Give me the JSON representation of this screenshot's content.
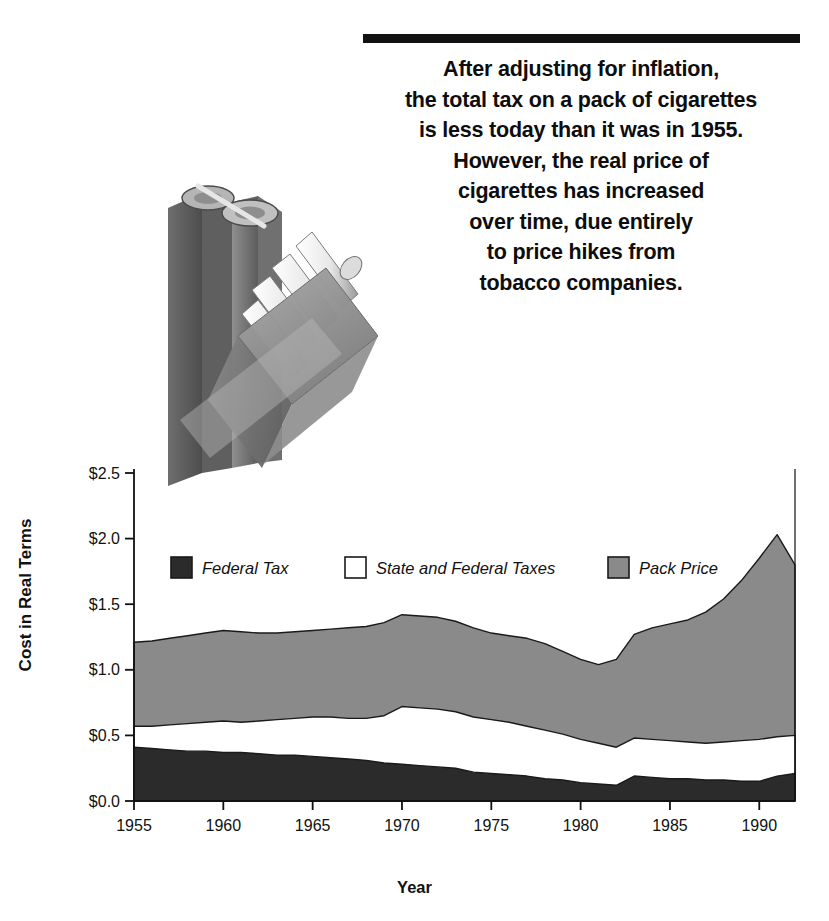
{
  "headline": {
    "lines": [
      "After adjusting for inflation,",
      "the total tax on a pack of cigarettes",
      "is less today than it was in 1955.",
      "However, the real price of",
      "cigarettes has increased",
      "over time, due entirely",
      "to price hikes from",
      "tobacco companies."
    ]
  },
  "illustration": {
    "name": "dollar-sign-and-cigarette-pack",
    "description": "Grayscale illustration of a dollar-sign shaped block beside an open pack of cigarettes"
  },
  "chart_data": {
    "type": "area",
    "stacked": true,
    "title": "",
    "xlabel": "Year",
    "ylabel": "Cost in Real Terms",
    "xlim": [
      1955,
      1992
    ],
    "ylim": [
      0.0,
      2.5
    ],
    "grid": false,
    "legend_position": "inside-top-left",
    "xticks": [
      1955,
      1960,
      1965,
      1970,
      1975,
      1980,
      1985,
      1990
    ],
    "xtick_labels": [
      "1955",
      "1960",
      "1965",
      "1970",
      "1975",
      "1980",
      "1985",
      "1990"
    ],
    "yticks": [
      0.0,
      0.5,
      1.0,
      1.5,
      2.0,
      2.5
    ],
    "ytick_labels": [
      "$0.0",
      "$0.5",
      "$1.0",
      "$1.5",
      "$2.0",
      "$2.5"
    ],
    "x": [
      1955,
      1956,
      1957,
      1958,
      1959,
      1960,
      1961,
      1962,
      1963,
      1964,
      1965,
      1966,
      1967,
      1968,
      1969,
      1970,
      1971,
      1972,
      1973,
      1974,
      1975,
      1976,
      1977,
      1978,
      1979,
      1980,
      1981,
      1982,
      1983,
      1984,
      1985,
      1986,
      1987,
      1988,
      1989,
      1990,
      1991,
      1992
    ],
    "series": [
      {
        "name": "Federal Tax",
        "color": "#2b2b2b",
        "values": [
          0.41,
          0.4,
          0.39,
          0.38,
          0.38,
          0.37,
          0.37,
          0.36,
          0.35,
          0.35,
          0.34,
          0.33,
          0.32,
          0.31,
          0.29,
          0.28,
          0.27,
          0.26,
          0.25,
          0.22,
          0.21,
          0.2,
          0.19,
          0.17,
          0.16,
          0.14,
          0.13,
          0.12,
          0.19,
          0.18,
          0.17,
          0.17,
          0.16,
          0.16,
          0.15,
          0.15,
          0.19,
          0.21
        ]
      },
      {
        "name": "State and Federal Taxes",
        "color": "#ffffff",
        "values": [
          0.57,
          0.57,
          0.58,
          0.59,
          0.6,
          0.61,
          0.6,
          0.61,
          0.62,
          0.63,
          0.64,
          0.64,
          0.63,
          0.63,
          0.65,
          0.72,
          0.71,
          0.7,
          0.68,
          0.64,
          0.62,
          0.6,
          0.57,
          0.54,
          0.51,
          0.47,
          0.44,
          0.41,
          0.48,
          0.47,
          0.46,
          0.45,
          0.44,
          0.45,
          0.46,
          0.47,
          0.49,
          0.5
        ]
      },
      {
        "name": "Pack Price",
        "color": "#8a8a8a",
        "values": [
          1.21,
          1.22,
          1.24,
          1.26,
          1.28,
          1.3,
          1.29,
          1.28,
          1.28,
          1.29,
          1.3,
          1.31,
          1.32,
          1.33,
          1.36,
          1.42,
          1.41,
          1.4,
          1.37,
          1.32,
          1.28,
          1.26,
          1.24,
          1.2,
          1.14,
          1.08,
          1.04,
          1.08,
          1.27,
          1.32,
          1.35,
          1.38,
          1.44,
          1.54,
          1.68,
          1.85,
          2.03,
          1.8
        ]
      }
    ]
  },
  "legend": {
    "items": [
      {
        "label": "Federal Tax",
        "color": "#2b2b2b"
      },
      {
        "label": "State and Federal Taxes",
        "color": "#ffffff"
      },
      {
        "label": "Pack Price",
        "color": "#8a8a8a"
      }
    ]
  }
}
